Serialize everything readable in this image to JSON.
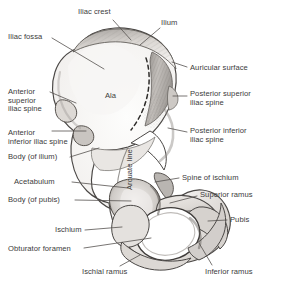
{
  "figure": {
    "colors": {
      "background": "#ffffff",
      "bone_fill": "#fbfbfa",
      "bone_shade_light": "#e6e4e1",
      "bone_shade_mid": "#bdb9b5",
      "bone_shade_dark": "#7e7a76",
      "outline": "#4a4745",
      "leader_line": "#55524f",
      "text": "#3b3b3b"
    },
    "labels": [
      {
        "id": "iliac-crest",
        "text": "Iliac crest",
        "x": 78,
        "y": 8,
        "align": "left"
      },
      {
        "id": "ilium",
        "text": "Ilium",
        "x": 161,
        "y": 19,
        "align": "left"
      },
      {
        "id": "iliac-fossa",
        "text": "Iliac fossa",
        "x": 8,
        "y": 33,
        "align": "left"
      },
      {
        "id": "auricular-surface",
        "text": "Auricular surface",
        "x": 190,
        "y": 64,
        "align": "left"
      },
      {
        "id": "anterior-superior-iliac-spine",
        "text": "Anterior\nsuperior\niliac spine",
        "x": 8,
        "y": 88,
        "align": "left"
      },
      {
        "id": "posterior-superior-iliac-spine",
        "text": "Posterior superior\niliac spine",
        "x": 190,
        "y": 90,
        "align": "left"
      },
      {
        "id": "ala",
        "text": "Ala",
        "x": 105,
        "y": 92,
        "align": "left"
      },
      {
        "id": "anterior-inferior-iliac-spine",
        "text": "Anterior\ninferior iliac spine",
        "x": 8,
        "y": 129,
        "align": "left"
      },
      {
        "id": "posterior-inferior-iliac-spine",
        "text": "Posterior inferior\niliac spine",
        "x": 190,
        "y": 127,
        "align": "left"
      },
      {
        "id": "body-of-ilium",
        "text": "Body (of ilium)",
        "x": 8,
        "y": 153,
        "align": "left"
      },
      {
        "id": "arcuate-line",
        "text": "Arcuate line",
        "x": 126,
        "y": 190,
        "align": "left",
        "rotated": true
      },
      {
        "id": "acetabulum",
        "text": "Acetabulum",
        "x": 14,
        "y": 178,
        "align": "left"
      },
      {
        "id": "spine-of-ischium",
        "text": "Spine of ischium",
        "x": 182,
        "y": 174,
        "align": "left"
      },
      {
        "id": "body-of-pubis",
        "text": "Body (of pubis)",
        "x": 8,
        "y": 196,
        "align": "left"
      },
      {
        "id": "superior-ramus",
        "text": "Superior ramus",
        "x": 200,
        "y": 191,
        "align": "left"
      },
      {
        "id": "ischium",
        "text": "Ischium",
        "x": 55,
        "y": 226,
        "align": "left"
      },
      {
        "id": "pubis",
        "text": "Pubis",
        "x": 230,
        "y": 216,
        "align": "left"
      },
      {
        "id": "obturator-foramen",
        "text": "Obturator foramen",
        "x": 8,
        "y": 245,
        "align": "left"
      },
      {
        "id": "ischial-ramus",
        "text": "Ischial ramus",
        "x": 82,
        "y": 268,
        "align": "left"
      },
      {
        "id": "inferior-ramus",
        "text": "Inferior ramus",
        "x": 205,
        "y": 268,
        "align": "left"
      }
    ],
    "leaders": [
      {
        "id": "leader-iliac-crest",
        "from": [
          113,
          20
        ],
        "to": [
          131,
          40
        ]
      },
      {
        "id": "leader-ilium",
        "from": [
          160,
          28
        ],
        "to": [
          140,
          45
        ]
      },
      {
        "id": "leader-iliac-fossa",
        "from": [
          52,
          38
        ],
        "to": [
          104,
          69
        ]
      },
      {
        "id": "leader-auricular-surface",
        "from": [
          187,
          67
        ],
        "to": [
          172,
          62
        ]
      },
      {
        "id": "leader-posterior-superior",
        "from": [
          187,
          96
        ],
        "to": [
          173,
          96
        ]
      },
      {
        "id": "leader-posterior-inferior",
        "from": [
          187,
          132
        ],
        "to": [
          168,
          128
        ]
      },
      {
        "id": "leader-anterior-superior",
        "from": [
          50,
          92
        ],
        "to": [
          76,
          103
        ]
      },
      {
        "id": "leader-anterior-inferior",
        "from": [
          52,
          131
        ],
        "to": [
          86,
          131
        ]
      },
      {
        "id": "leader-body-of-ilium",
        "from": [
          70,
          157
        ],
        "to": [
          99,
          148
        ]
      },
      {
        "id": "leader-acetabulum",
        "from": [
          72,
          182
        ],
        "to": [
          128,
          188
        ]
      },
      {
        "id": "leader-spine-of-ischium",
        "from": [
          179,
          178
        ],
        "to": [
          155,
          182
        ]
      },
      {
        "id": "leader-body-of-pubis",
        "from": [
          75,
          200
        ],
        "to": [
          131,
          201
        ]
      },
      {
        "id": "leader-superior-ramus",
        "from": [
          197,
          196
        ],
        "to": [
          170,
          203
        ]
      },
      {
        "id": "leader-ischium",
        "from": [
          85,
          230
        ],
        "to": [
          122,
          227
        ]
      },
      {
        "id": "leader-pubis",
        "from": [
          227,
          220
        ],
        "to": [
          208,
          221
        ]
      },
      {
        "id": "leader-obturator-foramen",
        "from": [
          84,
          248
        ],
        "to": [
          151,
          238
        ]
      },
      {
        "id": "leader-ischial-ramus",
        "from": [
          120,
          266
        ],
        "to": [
          140,
          255
        ]
      },
      {
        "id": "leader-inferior-ramus",
        "from": [
          212,
          265
        ],
        "to": [
          199,
          243
        ]
      }
    ]
  }
}
